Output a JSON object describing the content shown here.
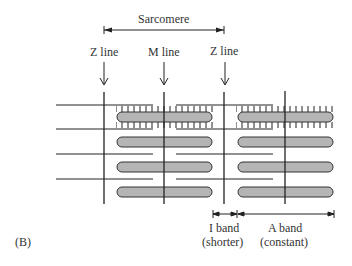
{
  "labels": {
    "sarcomere": "Sarcomere",
    "z_line_left": "Z line",
    "m_line": "M line",
    "z_line_right": "Z line",
    "i_band": "I band",
    "i_band_note": "(shorter)",
    "a_band": "A band",
    "a_band_note": "(constant)",
    "panel": "(B)"
  },
  "colors": {
    "line": "#222222",
    "thick_filament_fill": "#b5b5b5",
    "text": "#333333"
  }
}
